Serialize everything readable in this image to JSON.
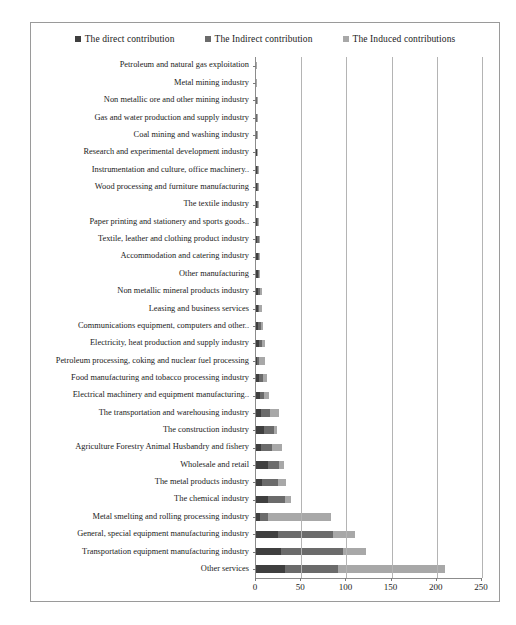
{
  "legend": {
    "position": "top-center",
    "entries": [
      {
        "label": "The direct contribution",
        "color": "#3f3f3f",
        "icon": "square-marker-icon"
      },
      {
        "label": "The Indirect contribution",
        "color": "#6b6b6b",
        "icon": "square-marker-icon"
      },
      {
        "label": "The Induced contributions",
        "color": "#a8a8a8",
        "icon": "square-marker-icon"
      }
    ]
  },
  "axis": {
    "x_ticks": [
      "0",
      "50",
      "100",
      "150",
      "200",
      "250"
    ],
    "x_min": 0,
    "x_max": 250
  },
  "chart_data": {
    "type": "bar",
    "orientation": "horizontal",
    "stacked": true,
    "title": "",
    "xlabel": "",
    "ylabel": "",
    "xlim": [
      0,
      250
    ],
    "grid": true,
    "legend_position": "top-center",
    "tick_labels": [
      "0",
      "50",
      "100",
      "150",
      "200",
      "250"
    ],
    "categories": [
      "Petroleum and natural gas exploitation",
      "Metal mining industry",
      "Non metallic ore and other mining industry",
      "Gas and water production and supply industry",
      "Coal mining and washing industry",
      "Research and experimental development industry",
      "Instrumentation and culture, office machinery..",
      "Wood processing and furniture manufacturing",
      "The textile industry",
      "Paper printing and stationery and sports goods..",
      "Textile, leather and clothing product industry",
      "Accommodation and catering industry",
      "Other manufacturing",
      "Non metallic mineral products industry",
      "Leasing and business services",
      "Communications equipment, computers and other..",
      "Electricity, heat production and supply industry",
      "Petroleum processing, coking and nuclear fuel processing",
      "Food manufacturing and tobacco processing industry",
      "Electrical machinery and equipment manufacturing..",
      "The transportation and warehousing industry",
      "The construction industry",
      "Agriculture Forestry Animal Husbandry and fishery",
      "Wholesale and retail",
      "The metal products industry",
      "The chemical industry",
      "Metal smelting and rolling processing industry",
      "General, special equipment manufacturing industry",
      "Transportation equipment manufacturing industry",
      "Other services"
    ],
    "series": [
      {
        "name": "The direct contribution",
        "color": "#3f3f3f",
        "values": [
          0.3,
          0.3,
          0.4,
          0.4,
          0.5,
          0.8,
          1.0,
          1.0,
          1.2,
          1.4,
          1.6,
          1.8,
          2.0,
          2.6,
          2.0,
          2.6,
          3.6,
          1.2,
          3.6,
          4.0,
          6.0,
          9.0,
          6.0,
          13.0,
          7.0,
          13.0,
          4.0,
          24.0,
          28.0,
          32.0
        ]
      },
      {
        "name": "The Indirect contribution",
        "color": "#6b6b6b",
        "values": [
          0.2,
          0.2,
          0.3,
          0.4,
          0.4,
          0.6,
          0.8,
          0.8,
          1.0,
          1.1,
          1.3,
          1.4,
          1.6,
          2.2,
          1.8,
          2.6,
          3.4,
          2.6,
          4.0,
          5.0,
          9.0,
          11.0,
          12.0,
          12.0,
          17.0,
          19.0,
          9.0,
          61.0,
          68.0,
          59.0
        ]
      },
      {
        "name": "The Induced contributions",
        "color": "#a8a8a8",
        "values": [
          0.1,
          0.2,
          0.2,
          0.3,
          0.3,
          0.5,
          0.7,
          0.7,
          0.9,
          1.0,
          1.1,
          1.3,
          1.4,
          1.9,
          2.4,
          2.8,
          3.0,
          6.6,
          4.4,
          5.0,
          10.0,
          3.0,
          11.0,
          6.0,
          9.0,
          7.0,
          70.0,
          25.0,
          26.0,
          118.0
        ]
      }
    ]
  }
}
